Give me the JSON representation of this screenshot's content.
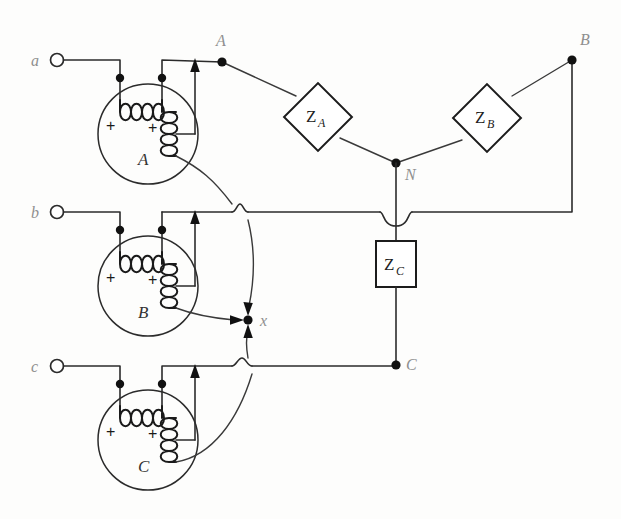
{
  "figure": {
    "type": "circuit-schematic",
    "canvas": {
      "width": 621,
      "height": 519
    },
    "colors": {
      "wire": "#2b2b2b",
      "coil": "#1a1a1a",
      "node": "#111111",
      "label_gray": "#8f8f8f",
      "background": "#fdfdfc"
    }
  },
  "source_terminals": [
    {
      "id": "a",
      "label": "a",
      "x": 57,
      "y": 60
    },
    {
      "id": "b",
      "label": "b",
      "x": 57,
      "y": 212
    },
    {
      "id": "c",
      "label": "c",
      "x": 57,
      "y": 366
    }
  ],
  "generators": [
    {
      "id": "A",
      "label": "A",
      "cx": 148,
      "cy": 134,
      "r": 50,
      "plus_left": "+",
      "plus_right": "+"
    },
    {
      "id": "B",
      "label": "B",
      "cx": 148,
      "cy": 286,
      "r": 50,
      "plus_left": "+",
      "plus_right": "+"
    },
    {
      "id": "C",
      "label": "C",
      "cx": 148,
      "cy": 440,
      "r": 50,
      "plus_left": "+",
      "plus_right": "+"
    }
  ],
  "line_nodes": [
    {
      "id": "A",
      "label": "A",
      "x": 222,
      "y": 62
    },
    {
      "id": "B",
      "label": "B",
      "x": 572,
      "y": 60
    },
    {
      "id": "C",
      "label": "C",
      "x": 396,
      "y": 365
    },
    {
      "id": "N",
      "label": "N",
      "x": 396,
      "y": 163
    },
    {
      "id": "x",
      "label": "x",
      "x": 248,
      "y": 320
    }
  ],
  "impedances": [
    {
      "id": "ZA",
      "symbol": "Z",
      "subscript": "A",
      "shape": "diamond",
      "cx": 318,
      "cy": 117,
      "size": 34,
      "rotation": 45
    },
    {
      "id": "ZB",
      "symbol": "Z",
      "subscript": "B",
      "shape": "diamond",
      "cx": 487,
      "cy": 118,
      "size": 34,
      "rotation": 45
    },
    {
      "id": "ZC",
      "symbol": "Z",
      "subscript": "C",
      "shape": "square",
      "cx": 396,
      "cy": 263,
      "width": 40,
      "height": 46,
      "rotation": 0
    }
  ],
  "wire_hops": [
    {
      "id": "hop-b-neutral",
      "x": 396,
      "y": 212,
      "note": "neutral line crosses phase-b line"
    },
    {
      "id": "hop-b-genA",
      "x": 240,
      "y": 212,
      "note": "generator A return crosses phase-b line"
    },
    {
      "id": "hop-c-genC",
      "x": 248,
      "y": 366,
      "note": "generator C return crosses phase-c line"
    }
  ],
  "current_arrows": [
    {
      "id": "arrow-genA-up",
      "direction": "up",
      "x": 195,
      "y": 62
    },
    {
      "id": "arrow-genB-up",
      "direction": "up",
      "x": 195,
      "y": 212
    },
    {
      "id": "arrow-genC-up",
      "direction": "up",
      "x": 195,
      "y": 366
    },
    {
      "id": "arrow-into-x-top",
      "direction": "down",
      "x": 248,
      "y": 310
    },
    {
      "id": "arrow-into-x-left",
      "direction": "right",
      "x": 238,
      "y": 320
    },
    {
      "id": "arrow-into-x-bottom",
      "direction": "up",
      "x": 248,
      "y": 331
    }
  ]
}
